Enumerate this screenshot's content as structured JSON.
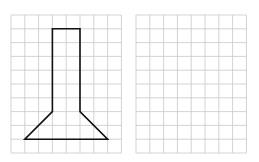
{
  "grids": [
    {
      "name": "left-grid",
      "x": 11,
      "y": 15,
      "cols": 8,
      "rows": 10,
      "cell": 13.8
    },
    {
      "name": "right-grid",
      "x": 136,
      "y": 15,
      "cols": 8,
      "rows": 10,
      "cell": 13.8
    }
  ],
  "shape": {
    "description": "flask-like shape: tall rectangle neck with trapezoid base",
    "points_grid_units": [
      [
        3,
        1
      ],
      [
        5,
        1
      ],
      [
        5,
        7
      ],
      [
        7,
        9
      ],
      [
        1,
        9
      ],
      [
        3,
        7
      ]
    ]
  },
  "colors": {
    "grid_line": "#c8c8c8",
    "shape_stroke": "#111111",
    "background": "#ffffff"
  }
}
